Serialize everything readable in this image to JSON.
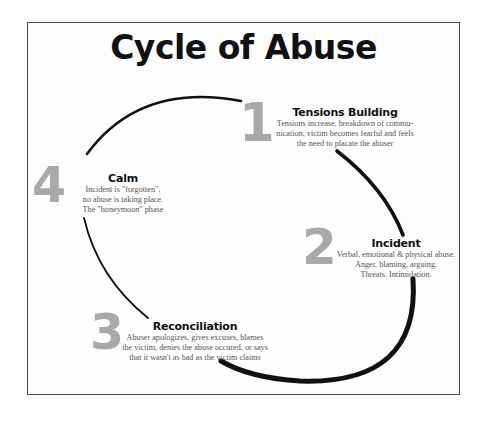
{
  "title": "Cycle of Abuse",
  "colors": {
    "frame_border": "#4a4a4a",
    "title": "#111111",
    "stage_number": "#a9a9a9",
    "body_text": "#555555",
    "arc": "#111111"
  },
  "stages": [
    {
      "number": "1",
      "heading": "Tensions Building",
      "lines": [
        "Tensions increase, breakdown of commu-",
        "nication, victim becomes fearful and feels",
        "the need to placate the abuser"
      ]
    },
    {
      "number": "2",
      "heading": "Incident",
      "lines": [
        "Verbal, emotional & physical abuse.",
        "Anger, blaming, arguing.",
        "Threats.  Intimidation."
      ]
    },
    {
      "number": "3",
      "heading": "Reconciliation",
      "lines": [
        "Abuser apologizes, gives excuses, blames",
        "the victim, denies the abuse occured, or says",
        "that it wasn't as bad as the victim claims"
      ]
    },
    {
      "number": "4",
      "heading": "Calm",
      "lines": [
        "Incident is \"forgotten\",",
        "no abuse is taking place.",
        "The \"honeymoon\" phase"
      ]
    }
  ]
}
